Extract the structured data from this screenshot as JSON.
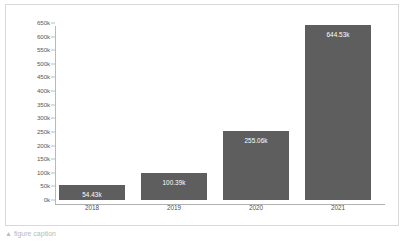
{
  "chart_data": {
    "type": "bar",
    "title": "",
    "subtitle": "",
    "xlabel": "",
    "ylabel": "",
    "categories": [
      "2018",
      "2019",
      "2020",
      "2021"
    ],
    "values": [
      54430,
      100390,
      255060,
      644530
    ],
    "data_labels": [
      "54.43k",
      "100.39k",
      "255.06k",
      "644.53k"
    ],
    "ylim": [
      0,
      650000
    ],
    "ytick_labels": [
      "0k",
      "50k",
      "100k",
      "150k",
      "200k",
      "250k",
      "300k",
      "350k",
      "400k",
      "450k",
      "500k",
      "550k",
      "600k",
      "650k"
    ],
    "ytick_values": [
      0,
      50000,
      100000,
      150000,
      200000,
      250000,
      300000,
      350000,
      400000,
      450000,
      500000,
      550000,
      600000,
      650000
    ],
    "grid": false,
    "legend": null,
    "legend_position": "none",
    "bar_color": "#5e5e5e",
    "data_label_color": "#ffffff",
    "axis_color": "#b9b9b9",
    "background_color": "#ffffff",
    "border_color": "#d9d9d9"
  },
  "caption": {
    "bullet": "▲",
    "text": "figure caption"
  }
}
